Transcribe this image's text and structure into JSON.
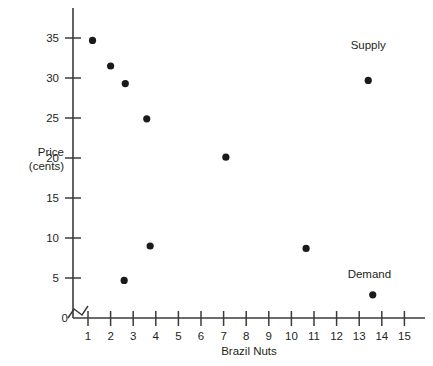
{
  "chart_data": {
    "type": "scatter",
    "title": "",
    "xlabel": "Brazil Nuts",
    "ylabel": "Price\n(cents)",
    "ylabel_line1": "Price",
    "ylabel_line2": "(cents)",
    "xlim": [
      0.4,
      15.6
    ],
    "ylim": [
      0,
      37.5
    ],
    "x_ticks": [
      1,
      2,
      3,
      4,
      5,
      6,
      7,
      8,
      9,
      10,
      11,
      12,
      13,
      14,
      15
    ],
    "x_tick_labels": [
      "1",
      "2",
      "3",
      "4",
      "5",
      "6",
      "7",
      "8",
      "9",
      "10",
      "11",
      "12",
      "13",
      "14",
      "15"
    ],
    "y_ticks": [
      5,
      10,
      15,
      20,
      25,
      30,
      35
    ],
    "y_tick_labels": [
      "5",
      "10",
      "15",
      "20",
      "25",
      "30",
      "35"
    ],
    "origin_label": "0",
    "grid": false,
    "axis_break_x": true,
    "legend_position": "inline-annotations",
    "series": [
      {
        "name": "Supply",
        "annotation_label": "Supply",
        "annotation_x": 13.4,
        "annotation_y": 33.6,
        "points": [
          {
            "x": 1.2,
            "y": 34.7
          },
          {
            "x": 2.0,
            "y": 31.5
          },
          {
            "x": 2.65,
            "y": 29.3
          },
          {
            "x": 3.6,
            "y": 24.9
          },
          {
            "x": 7.1,
            "y": 20.1
          },
          {
            "x": 10.65,
            "y": 8.7
          },
          {
            "x": 13.4,
            "y": 29.7
          }
        ]
      },
      {
        "name": "Demand",
        "annotation_label": "Demand",
        "annotation_x": 13.45,
        "annotation_y": 5.0,
        "points": [
          {
            "x": 2.6,
            "y": 4.7
          },
          {
            "x": 3.75,
            "y": 9.0
          },
          {
            "x": 13.6,
            "y": 2.9
          }
        ]
      }
    ],
    "all_points": [
      {
        "x": 1.2,
        "y": 34.7
      },
      {
        "x": 2.0,
        "y": 31.5
      },
      {
        "x": 2.65,
        "y": 29.3
      },
      {
        "x": 3.6,
        "y": 24.9
      },
      {
        "x": 3.75,
        "y": 9.0
      },
      {
        "x": 2.6,
        "y": 4.7
      },
      {
        "x": 7.1,
        "y": 20.1
      },
      {
        "x": 10.65,
        "y": 8.7
      },
      {
        "x": 13.4,
        "y": 29.7
      },
      {
        "x": 13.6,
        "y": 2.9
      }
    ],
    "colors": {
      "point": "#1a1a1a",
      "axis": "#3b3b3b",
      "text": "#231f20",
      "background": "#ffffff"
    }
  }
}
